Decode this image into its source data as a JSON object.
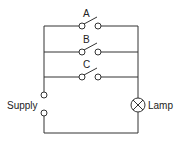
{
  "diagram": {
    "type": "circuit",
    "switches": [
      {
        "label": "A"
      },
      {
        "label": "B"
      },
      {
        "label": "C"
      }
    ],
    "supply_label": "Supply",
    "lamp_label": "Lamp",
    "colors": {
      "line": "#333333",
      "background": "#ffffff"
    }
  }
}
